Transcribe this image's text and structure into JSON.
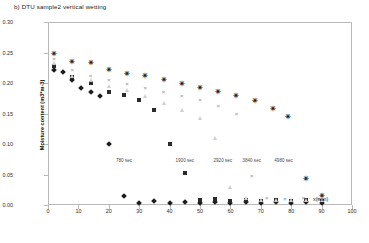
{
  "title": "b) DTU sample2 vertical wetting",
  "axis": {
    "ylabel": "Moisture content (m3*m-3)",
    "xlabel": "x(mm)",
    "yticks": [
      "0.00",
      "0.05",
      "0.10",
      "0.15",
      "0.20",
      "0.25",
      "0.30"
    ],
    "xticks": [
      "0",
      "10",
      "20",
      "30",
      "40",
      "50",
      "60",
      "70",
      "80",
      "90",
      "100"
    ]
  },
  "annotations": [
    {
      "text": "780 sec",
      "x": 25,
      "y": 0.072
    },
    {
      "text": "1900 sec",
      "x": 45,
      "y": 0.072
    },
    {
      "text": "2920 sec",
      "x": 57.5,
      "y": 0.072
    },
    {
      "text": "3840 sec",
      "x": 67,
      "y": 0.072
    },
    {
      "text": "4980 sec",
      "x": 77.5,
      "y": 0.072
    }
  ],
  "chart_data": {
    "type": "scatter",
    "title": "b) DTU sample2 vertical wetting",
    "xlabel": "x(mm)",
    "ylabel": "Moisture content (m3*m-3)",
    "xlim": [
      0,
      100
    ],
    "ylim": [
      0.0,
      0.3
    ],
    "grid": false,
    "legend": "none",
    "series": [
      {
        "name": "780 sec",
        "marker": "diamond",
        "color": "#1c1c1c",
        "points": [
          {
            "x": 2,
            "y": 0.222
          },
          {
            "x": 5,
            "y": 0.218
          },
          {
            "x": 8,
            "y": 0.205
          },
          {
            "x": 11,
            "y": 0.192
          },
          {
            "x": 14,
            "y": 0.185
          },
          {
            "x": 17,
            "y": 0.178
          },
          {
            "x": 20,
            "y": 0.1
          },
          {
            "x": 25,
            "y": 0.014
          },
          {
            "x": 30,
            "y": 0.004
          },
          {
            "x": 35,
            "y": 0.006
          },
          {
            "x": 40,
            "y": 0.003
          },
          {
            "x": 45,
            "y": 0.005
          },
          {
            "x": 50,
            "y": 0.004
          },
          {
            "x": 55,
            "y": 0.005
          },
          {
            "x": 60,
            "y": 0.004
          },
          {
            "x": 65,
            "y": 0.005
          },
          {
            "x": 70,
            "y": 0.004
          },
          {
            "x": 75,
            "y": 0.005
          },
          {
            "x": 80,
            "y": 0.004
          },
          {
            "x": 85,
            "y": 0.005
          },
          {
            "x": 90,
            "y": 0.004
          }
        ]
      },
      {
        "name": "1900 sec",
        "marker": "square",
        "color": "#2a2a2a",
        "points": [
          {
            "x": 2,
            "y": 0.228
          },
          {
            "x": 8,
            "y": 0.21
          },
          {
            "x": 14,
            "y": 0.2
          },
          {
            "x": 20,
            "y": 0.185
          },
          {
            "x": 25,
            "y": 0.18
          },
          {
            "x": 30,
            "y": 0.172
          },
          {
            "x": 35,
            "y": 0.155
          },
          {
            "x": 40,
            "y": 0.1
          },
          {
            "x": 45,
            "y": 0.052
          },
          {
            "x": 50,
            "y": 0.008
          },
          {
            "x": 55,
            "y": 0.01
          },
          {
            "x": 60,
            "y": 0.006
          },
          {
            "x": 65,
            "y": 0.008
          },
          {
            "x": 70,
            "y": 0.007
          },
          {
            "x": 75,
            "y": 0.008
          },
          {
            "x": 80,
            "y": 0.007
          },
          {
            "x": 85,
            "y": 0.008
          },
          {
            "x": 90,
            "y": 0.007
          }
        ]
      },
      {
        "name": "2920 sec",
        "marker": "triangle",
        "color": "#cfcfcf",
        "points": [
          {
            "x": 2,
            "y": 0.232
          },
          {
            "x": 8,
            "y": 0.212
          },
          {
            "x": 14,
            "y": 0.205
          },
          {
            "x": 20,
            "y": 0.195
          },
          {
            "x": 26,
            "y": 0.188
          },
          {
            "x": 32,
            "y": 0.178
          },
          {
            "x": 38,
            "y": 0.168
          },
          {
            "x": 44,
            "y": 0.155
          },
          {
            "x": 50,
            "y": 0.142
          },
          {
            "x": 55,
            "y": 0.11
          },
          {
            "x": 60,
            "y": 0.03
          },
          {
            "x": 65,
            "y": 0.012
          },
          {
            "x": 70,
            "y": 0.008
          },
          {
            "x": 75,
            "y": 0.009
          },
          {
            "x": 80,
            "y": 0.008
          },
          {
            "x": 85,
            "y": 0.009
          },
          {
            "x": 90,
            "y": 0.008
          }
        ]
      },
      {
        "name": "3840 sec",
        "marker": "x",
        "color": "#a9a9a9",
        "points": [
          {
            "x": 2,
            "y": 0.24
          },
          {
            "x": 8,
            "y": 0.222
          },
          {
            "x": 14,
            "y": 0.212
          },
          {
            "x": 20,
            "y": 0.205
          },
          {
            "x": 26,
            "y": 0.198
          },
          {
            "x": 32,
            "y": 0.192
          },
          {
            "x": 38,
            "y": 0.185
          },
          {
            "x": 44,
            "y": 0.178
          },
          {
            "x": 50,
            "y": 0.172
          },
          {
            "x": 56,
            "y": 0.162
          },
          {
            "x": 62,
            "y": 0.15
          },
          {
            "x": 67,
            "y": 0.048
          },
          {
            "x": 72,
            "y": 0.012
          },
          {
            "x": 78,
            "y": 0.01
          },
          {
            "x": 84,
            "y": 0.011
          },
          {
            "x": 89,
            "y": 0.01
          }
        ]
      },
      {
        "name": "4980 sec",
        "marker": "star",
        "color": "#141414",
        "points": [
          {
            "x": 2,
            "y": 0.248
          },
          {
            "x": 8,
            "y": 0.235
          },
          {
            "x": 14,
            "y": 0.232
          },
          {
            "x": 20,
            "y": 0.222
          },
          {
            "x": 26,
            "y": 0.215
          },
          {
            "x": 32,
            "y": 0.212
          },
          {
            "x": 38,
            "y": 0.205
          },
          {
            "x": 44,
            "y": 0.198
          },
          {
            "x": 50,
            "y": 0.192
          },
          {
            "x": 56,
            "y": 0.185
          },
          {
            "x": 62,
            "y": 0.178
          },
          {
            "x": 68,
            "y": 0.17
          },
          {
            "x": 74,
            "y": 0.158
          },
          {
            "x": 79,
            "y": 0.145
          },
          {
            "x": 85,
            "y": 0.042
          },
          {
            "x": 90,
            "y": 0.014
          }
        ]
      }
    ]
  }
}
